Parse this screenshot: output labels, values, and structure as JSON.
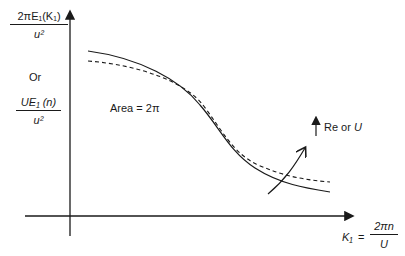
{
  "diagram": {
    "y_axis": {
      "label_top": {
        "numerator": "2πE₁(K₁)",
        "denominator": "u²"
      },
      "label_or": "Or",
      "label_bottom": {
        "numerator": "UE₁ (n)",
        "denominator": "u²"
      }
    },
    "x_axis": {
      "label_lhs": "K₁",
      "equals": "=",
      "label_rhs": {
        "numerator": "2πn",
        "denominator": "U"
      }
    },
    "annotations": {
      "area": "Area = 2π",
      "trend_prefix": "Re or ",
      "trend_var": "U"
    },
    "curves": [
      {
        "name": "solid",
        "style": "solid"
      },
      {
        "name": "dashed",
        "style": "dashed"
      }
    ],
    "colors": {
      "ink": "#1a1a1a",
      "background": "#ffffff"
    }
  }
}
